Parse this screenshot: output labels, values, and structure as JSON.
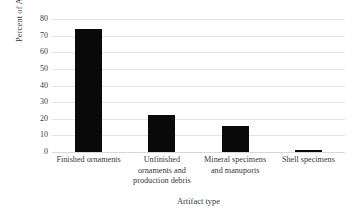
{
  "chart_data": {
    "type": "bar",
    "title": "",
    "xlabel": "Artifact type",
    "ylabel": "Percent of Analyzed Assemblage",
    "categories": [
      "Finished ornaments",
      "Unfinished ornaments and production debris",
      "Mineral specimens and manuports",
      "Shell specimens"
    ],
    "values": [
      74,
      22,
      15.5,
      1.5
    ],
    "ylim": [
      0,
      80
    ],
    "ytick_labels": [
      "80",
      "70",
      "60",
      "50",
      "40",
      "30",
      "20",
      "10",
      "0"
    ],
    "ytick_values": [
      80,
      70,
      60,
      50,
      40,
      30,
      20,
      10,
      0
    ],
    "grid": true,
    "legend": "none",
    "bar_color": "#0a0a0a",
    "grid_color": "#e4e4e4",
    "background_color": "#ffffff"
  },
  "axis": {
    "y_title": "Percent of Analyzed Assemblage",
    "x_title": "Artifact type"
  },
  "category_label_lines": [
    [
      "Finished ornaments"
    ],
    [
      "Unfinished",
      "ornaments and",
      "production debris"
    ],
    [
      "Mineral specimens",
      "and manuports"
    ],
    [
      "Shell specimens"
    ]
  ]
}
